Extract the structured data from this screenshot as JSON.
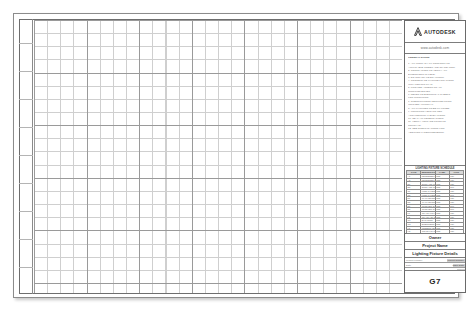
{
  "sheet": {
    "title_block": {
      "logo": {
        "mark": "autodesk-a-mark",
        "wordmark": "AUTODESK"
      },
      "url": "www.autodesk.com",
      "notes_heading": "GENERAL NOTES",
      "notes": [
        "1. ALL WORK SHALL CONFORM TO",
        "   APPLICABLE CODES AND STANDARDS.",
        "2. CONTRACTOR TO VERIFY ALL",
        "   DIMENSIONS IN FIELD.",
        "3. DO NOT SCALE DRAWINGS.",
        "4. COORDINATE FIXTURE LOCATIONS",
        "   WITH CEILING PLAN.",
        "5. PROVIDE ACCESS TO ALL",
        "   JUNCTION BOXES.",
        "6. REFER TO ELECTRICAL SHEETS",
        "   FOR CIRCUITING.",
        "7. SUBSTITUTIONS REQUIRE PRIOR",
        "   WRITTEN APPROVAL.",
        "8. ALL FIXTURES TO BE UL LISTED.",
        "9. MOUNTING HEIGHTS PER",
        "   ARCHITECTURAL ELEVATIONS.",
        "10. SEAL ALL PENETRATIONS.",
        "11. VERIFY VOLTAGE PRIOR TO",
        "    ROUGH-IN.",
        "12. SEE SPECIFICATIONS FOR",
        "    ADDITIONAL REQUIREMENTS."
      ],
      "schedule": {
        "title": "LIGHTING FIXTURE SCHEDULE",
        "columns": [
          "TYPE",
          "DESCRIPTION",
          "LAMP",
          "VOLT"
        ],
        "rows": [
          [
            "A1",
            "RECESSED DOWNLIGHT",
            "LED",
            "120"
          ],
          [
            "A2",
            "RECESSED DOWNLIGHT",
            "LED",
            "120"
          ],
          [
            "B1",
            "SURFACE MOUNT",
            "LED",
            "120"
          ],
          [
            "B2",
            "SURFACE MOUNT",
            "LED",
            "277"
          ],
          [
            "C1",
            "LINEAR PENDANT",
            "LED",
            "120"
          ],
          [
            "C2",
            "LINEAR PENDANT",
            "LED",
            "277"
          ],
          [
            "D1",
            "WALL SCONCE",
            "LED",
            "120"
          ],
          [
            "D2",
            "WALL SCONCE",
            "LED",
            "120"
          ],
          [
            "E1",
            "TROFFER 2X4",
            "LED",
            "277"
          ],
          [
            "E2",
            "TROFFER 2X2",
            "LED",
            "277"
          ],
          [
            "F1",
            "TRACK LIGHT",
            "LED",
            "120"
          ],
          [
            "F2",
            "TRACK HEAD",
            "LED",
            "120"
          ],
          [
            "G1",
            "EXIT SIGN",
            "LED",
            "120"
          ],
          [
            "G2",
            "EMERGENCY UNIT",
            "LED",
            "120"
          ],
          [
            "H1",
            "UNDERCABINET",
            "LED",
            "120"
          ],
          [
            "H2",
            "COVE LIGHTING",
            "LED",
            "120"
          ],
          [
            "J1",
            "EXTERIOR WALL PACK",
            "LED",
            "277"
          ],
          [
            "J2",
            "POLE MOUNTED",
            "LED",
            "277"
          ]
        ]
      },
      "owner": "Owner",
      "project_name": "Project Name",
      "sheet_title": "Lighting Fixture Details",
      "meta": [
        {
          "key": "Project number",
          "value": "Project Number"
        },
        {
          "key": "Date",
          "value": "Issue Date"
        },
        {
          "key": "Drawn by",
          "value": "Author"
        }
      ],
      "sheet_number": "G7"
    }
  },
  "colors": {
    "grid_minor": "#cfcfcf",
    "grid_major": "#9a9a9a",
    "border": "#6a6a6a",
    "text": "#2e2e2e"
  }
}
